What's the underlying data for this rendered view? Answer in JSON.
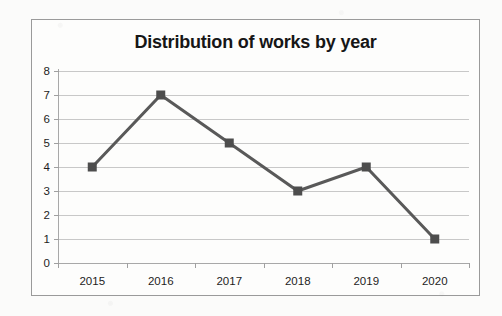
{
  "chart_data": {
    "type": "line",
    "title": "Distribution of works by year",
    "categories": [
      "2015",
      "2016",
      "2017",
      "2018",
      "2019",
      "2020"
    ],
    "values": [
      4,
      7,
      5,
      3,
      4,
      1
    ],
    "series": [
      {
        "name": "works",
        "values": [
          4,
          7,
          5,
          3,
          4,
          1
        ]
      }
    ],
    "xlabel": "",
    "ylabel": "",
    "ylim": [
      0,
      8
    ],
    "ytick_labels": [
      "0",
      "1",
      "2",
      "3",
      "4",
      "5",
      "6",
      "7",
      "8"
    ],
    "ytick_values": [
      0,
      1,
      2,
      3,
      4,
      5,
      6,
      7,
      8
    ],
    "ytick_step": 1,
    "grid": true,
    "legend": false,
    "marker": "square",
    "colors": {
      "line": "#595959",
      "marker": "#4d4d4d",
      "gridline": "#c8c8c8",
      "axis": "#a8a8a8",
      "title_text": "#161616",
      "tick_text": "#1d1d1d",
      "plot_background": "#fdfdfc",
      "frame_border": "#9a9a9a",
      "page_background": "#fbfbfa"
    }
  }
}
